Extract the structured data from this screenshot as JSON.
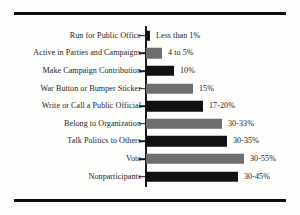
{
  "chart_data": {
    "type": "bar",
    "orientation": "horizontal",
    "title": "",
    "subtitle": "",
    "xlabel": "",
    "ylabel": "",
    "xlim": [
      0,
      60
    ],
    "grid": false,
    "legend": "none",
    "value_label_position": "outside-right",
    "axis_line": "vertical category axis with tick marks",
    "colors": {
      "bar_dark": "#111111",
      "bar_gray": "#6e6e6e",
      "rule": "#0d0d0d",
      "text": "#1f1f1f",
      "background": "#fdfdfc"
    },
    "categories": [
      "Run for Public Office",
      "Active in Parties and Campaigns",
      "Make Campaign Contribution",
      "War Button or Bumper Sticker",
      "Write or Call a Public Official",
      "Belong to Organization",
      "Talk Politics to Others",
      "Vote",
      "Nonparticipants"
    ],
    "values": [
      1,
      5,
      10,
      15,
      20,
      33,
      35,
      55,
      45
    ],
    "value_labels": [
      "Less than 1%",
      "4 to 5%",
      "10%",
      "15%",
      "17-20%",
      "30-33%",
      "30-35%",
      "30-55%",
      "30-45%"
    ],
    "bars": [
      {
        "category": "Run for Public Office",
        "value": 1,
        "label": "Less than 1%",
        "shade": "dark",
        "bar_px": 4
      },
      {
        "category": "Active in Parties and Campaigns",
        "value": 5,
        "label": "4 to 5%",
        "shade": "gray",
        "bar_px": 16
      },
      {
        "category": "Make Campaign Contribution",
        "value": 10,
        "label": "10%",
        "shade": "dark",
        "bar_px": 28
      },
      {
        "category": "War Button or Bumper Sticker",
        "value": 15,
        "label": "15%",
        "shade": "gray",
        "bar_px": 47
      },
      {
        "category": "Write or Call a Public Official",
        "value": 20,
        "label": "17-20%",
        "shade": "dark",
        "bar_px": 57
      },
      {
        "category": "Belong to Organization",
        "value": 33,
        "label": "30-33%",
        "shade": "gray",
        "bar_px": 76
      },
      {
        "category": "Talk Politics to Others",
        "value": 35,
        "label": "30-35%",
        "shade": "dark",
        "bar_px": 81
      },
      {
        "category": "Vote",
        "value": 55,
        "label": "30-55%",
        "shade": "gray",
        "bar_px": 98
      },
      {
        "category": "Nonparticipants",
        "value": 45,
        "label": "30-45%",
        "shade": "dark",
        "bar_px": 92
      }
    ]
  }
}
